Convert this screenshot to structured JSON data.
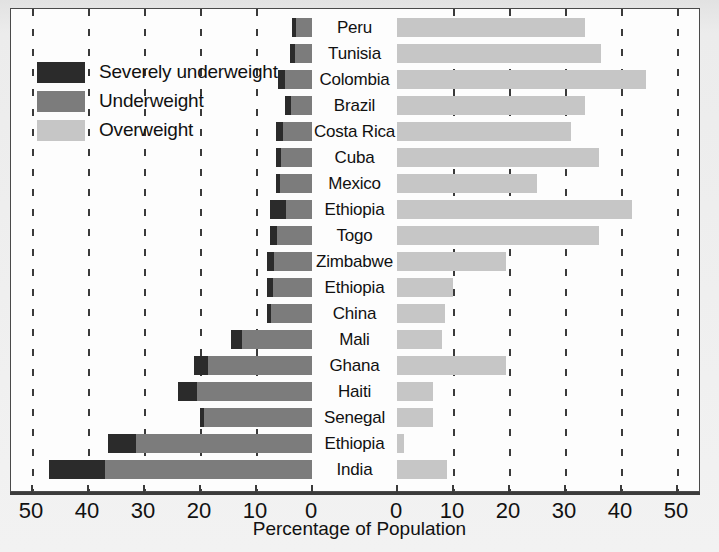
{
  "chart_data": {
    "type": "bar",
    "title": "",
    "subtitle": "",
    "xlabel": "Percentage of Population",
    "ylabel": "",
    "orientation": "horizontal",
    "style": "diverging-population-pyramid",
    "grid": true,
    "legend_position": "top-left",
    "left_axis": {
      "label": "",
      "ticks": [
        50,
        40,
        30,
        20,
        10,
        0
      ],
      "range": [
        50,
        0
      ]
    },
    "right_axis": {
      "label": "",
      "ticks": [
        0,
        10,
        20,
        30,
        40,
        50
      ],
      "range": [
        0,
        50
      ]
    },
    "legend": [
      {
        "name": "Severely underweight",
        "color": "#2b2b2b"
      },
      {
        "name": "Underweight",
        "color": "#7c7c7c"
      },
      {
        "name": "Overweight",
        "color": "#c6c6c6"
      }
    ],
    "categories": [
      "Peru",
      "Tunisia",
      "Colombia",
      "Brazil",
      "Costa Rica",
      "Cuba",
      "Mexico",
      "Ethiopia",
      "Togo",
      "Zimbabwe",
      "Ethiopia",
      "China",
      "Mali",
      "Ghana",
      "Haiti",
      "Senegal",
      "Ethiopia",
      "India"
    ],
    "series": [
      {
        "name": "Severely underweight",
        "color": "#2b2b2b",
        "values": [
          0.7,
          1.0,
          1.2,
          1.0,
          1.3,
          1.0,
          0.8,
          2.8,
          1.2,
          1.2,
          1.0,
          0.7,
          2.0,
          2.5,
          3.5,
          0.7,
          5.0,
          10.0
        ]
      },
      {
        "name": "Underweight",
        "color": "#7c7c7c",
        "values": [
          3.5,
          4.0,
          6.0,
          4.8,
          6.5,
          6.5,
          6.5,
          7.5,
          7.5,
          8.0,
          8.0,
          8.0,
          14.5,
          21.0,
          24.0,
          20.0,
          36.5,
          47.0
        ]
      },
      {
        "name": "Overweight",
        "color": "#c6c6c6",
        "values": [
          33.5,
          36.5,
          44.5,
          33.5,
          31.0,
          36.0,
          25.0,
          42.0,
          36.0,
          19.5,
          10.0,
          8.5,
          8.0,
          19.5,
          6.5,
          6.5,
          1.2,
          9.0
        ]
      }
    ]
  },
  "axis_labels": {
    "left": [
      "50",
      "40",
      "30",
      "20",
      "10",
      "0"
    ],
    "right": [
      "0",
      "10",
      "20",
      "30",
      "40",
      "50"
    ]
  },
  "colors": {
    "severe": "#2b2b2b",
    "under": "#7c7c7c",
    "over": "#c6c6c6",
    "axis": "#3b3b3b",
    "plot_background": "#fdfdfd",
    "figure_background": "#ececec"
  }
}
